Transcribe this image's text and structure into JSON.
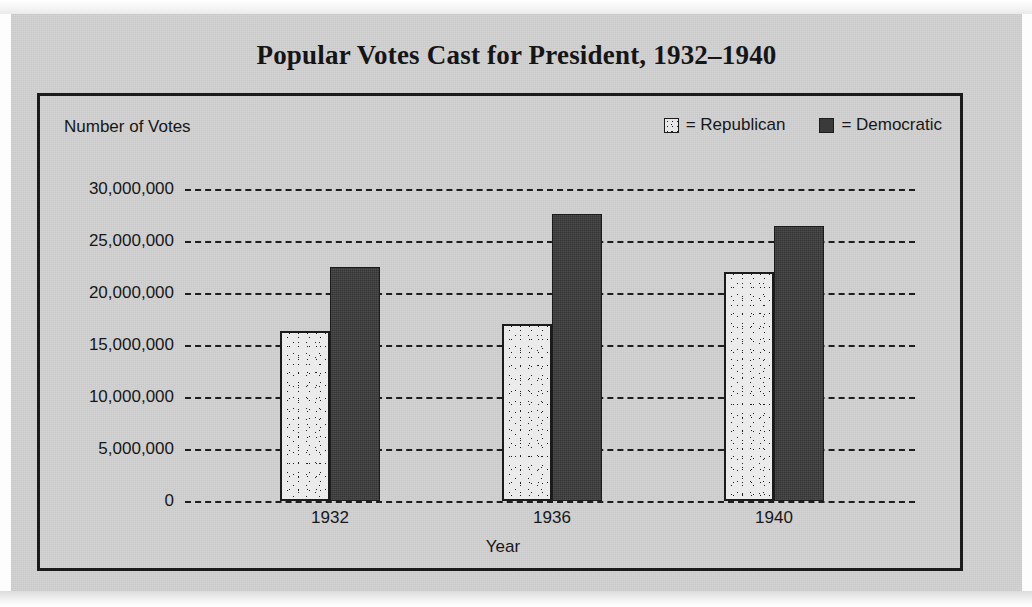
{
  "document": {
    "page_background": "#fdfdfd",
    "panel_background": "#d2d2d2"
  },
  "chart_data": {
    "type": "bar",
    "title": "Popular Votes Cast for President, 1932–1940",
    "xlabel": "Year",
    "ylabel": "Number of Votes",
    "categories": [
      "1932",
      "1936",
      "1940"
    ],
    "series": [
      {
        "name": "Republican",
        "legend_label": "= Republican",
        "swatch": "stippled-light",
        "color": "#ebebeb",
        "values": [
          16300000,
          17000000,
          22000000
        ]
      },
      {
        "name": "Democratic",
        "legend_label": "= Democratic",
        "swatch": "solid-dark",
        "color": "#3b3b3b",
        "values": [
          22500000,
          27600000,
          26400000
        ]
      }
    ],
    "ylim": [
      0,
      30000000
    ],
    "ytick_values": [
      30000000,
      25000000,
      20000000,
      15000000,
      10000000,
      5000000,
      0
    ],
    "ytick_labels": [
      "30,000,000",
      "25,000,000",
      "20,000,000",
      "15,000,000",
      "10,000,000",
      "5,000,000",
      "0"
    ],
    "grid": true,
    "grid_style": "dashed-horizontal",
    "legend_position": "top-right",
    "axis_color": "#1d1d1d"
  }
}
